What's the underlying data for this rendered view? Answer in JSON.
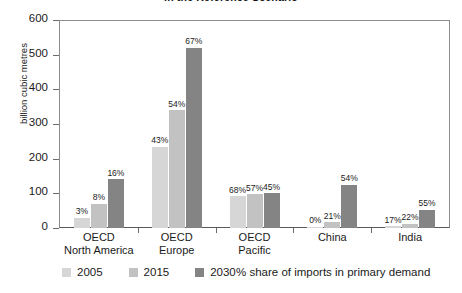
{
  "chart_data": {
    "type": "bar",
    "title": "in the Reference Scenario",
    "xlabel": "",
    "ylabel": "billion cubic metres",
    "ylim": [
      0,
      600
    ],
    "yticks": [
      0,
      100,
      200,
      300,
      400,
      500,
      600
    ],
    "grid": false,
    "legend_position": "bottom-left",
    "categories": [
      "OECD North America",
      "OECD Europe",
      "OECD Pacific",
      "China",
      "India"
    ],
    "category_lines": [
      [
        "OECD",
        "North America"
      ],
      [
        "OECD",
        "Europe"
      ],
      [
        "OECD",
        "Pacific"
      ],
      [
        "China",
        ""
      ],
      [
        "India",
        ""
      ]
    ],
    "series": [
      {
        "name": "2005",
        "color": "#d6d6d6",
        "values": [
          30,
          235,
          92,
          2,
          5
        ],
        "labels": [
          "3%",
          "43%",
          "68%",
          "0%",
          "17%"
        ]
      },
      {
        "name": "2015",
        "color": "#c2c2c2",
        "values": [
          70,
          340,
          98,
          17,
          12
        ],
        "labels": [
          "8%",
          "54%",
          "57%",
          "21%",
          "22%"
        ]
      },
      {
        "name": "2030",
        "color": "#848484",
        "values": [
          140,
          520,
          100,
          125,
          53
        ],
        "labels": [
          "16%",
          "67%",
          "45%",
          "54%",
          "55%"
        ]
      }
    ],
    "annotation": "% share of imports in primary demand"
  }
}
